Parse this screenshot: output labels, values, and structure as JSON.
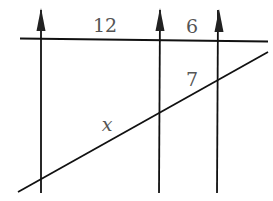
{
  "diagram": {
    "parallel_lines": [
      {
        "id": "p1",
        "x": 41,
        "arrow": "up"
      },
      {
        "id": "p2",
        "x": 160,
        "arrow": "up"
      },
      {
        "id": "p3",
        "x": 218,
        "arrow": "up"
      }
    ],
    "transversals": [
      {
        "id": "top",
        "from": [
          20,
          39
        ],
        "to": [
          268,
          41
        ]
      },
      {
        "id": "bottom",
        "from": [
          18,
          192
        ],
        "to": [
          268,
          52
        ]
      }
    ],
    "labels": {
      "top_left_segment": "12",
      "top_right_segment": "6",
      "bottom_right_segment": "7",
      "bottom_left_segment": "x"
    },
    "colors": {
      "line": "#111111",
      "label": "#555555",
      "background": "#ffffff"
    }
  }
}
